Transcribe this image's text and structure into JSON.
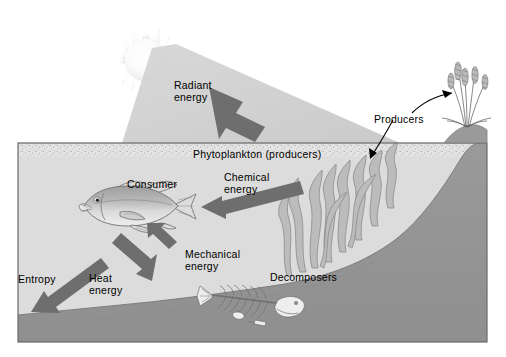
{
  "figure": {
    "kind": "ecosystem-energy-flow-diagram",
    "title_visible": false,
    "background_color": "#ffffff"
  },
  "labels": {
    "radiant_energy": "Radiant\nenergy",
    "producers": "Producers",
    "phytoplankton": "Phytoplankton (producers)",
    "chemical_energy": "Chemical\nenergy",
    "consumer": "Consumer",
    "mechanical_energy": "Mechanical\nenergy",
    "heat_energy": "Heat\nenergy",
    "entropy": "Entropy",
    "decomposers": "Decomposers"
  },
  "palette": {
    "water": "#d9d9d9",
    "water_light": "#e0e0e0",
    "seafloor": "#959595",
    "seafloor_dark": "#8a8a8a",
    "arrow_gray": "#6e6e6e",
    "beam_gray": "#c9c9c9",
    "sun_core": "#ffffff",
    "sun_edge": "#eaeaea",
    "outline": "#555555",
    "box_border": "#6a6a6a",
    "text": "#000000",
    "fish_body": "#b4b4b4",
    "fish_light": "#dcdcdc",
    "kelp": "#8e8e8e",
    "bone": "#e8e8e8"
  },
  "icons": {
    "sun": "sun-icon",
    "beam": "light-beam-icon",
    "fish": "fish-icon",
    "skeleton": "fish-skeleton-icon",
    "kelp": "kelp-icon",
    "grass": "shore-grass-icon",
    "arrow_radiant": "arrow-radiant-energy-icon",
    "arrow_chemical": "arrow-chemical-energy-icon",
    "arrow_heat": "arrow-heat-energy-icon",
    "arrow_mechanical": "arrow-mechanical-energy-icon",
    "pointer_producers_grass": "pointer-producers-grass-icon",
    "pointer_producers_kelp": "pointer-producers-kelp-icon"
  },
  "label_positions": {
    "radiant_energy": {
      "x": 174,
      "y": 79
    },
    "producers": {
      "x": 374,
      "y": 113
    },
    "phytoplankton": {
      "x": 193,
      "y": 148
    },
    "chemical_energy": {
      "x": 224,
      "y": 171
    },
    "consumer": {
      "x": 127,
      "y": 178
    },
    "mechanical_energy": {
      "x": 185,
      "y": 248
    },
    "heat_energy": {
      "x": 89,
      "y": 272
    },
    "entropy": {
      "x": 18,
      "y": 273
    },
    "decomposers": {
      "x": 270,
      "y": 271
    }
  },
  "geometry": {
    "water_box": {
      "x": 18,
      "y": 143,
      "width": 469,
      "height": 199
    },
    "surface_band_height": 13,
    "sun": {
      "cx": 146,
      "cy": 60,
      "r": 21,
      "spikes": 14
    },
    "fish": {
      "cx": 128,
      "cy": 206
    },
    "skeleton": {
      "cx": 248,
      "cy": 305
    }
  }
}
